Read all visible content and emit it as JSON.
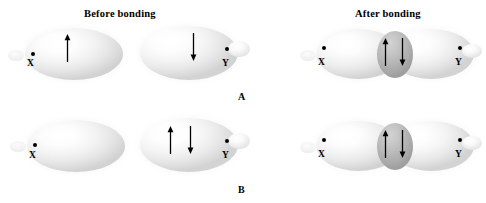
{
  "figure": {
    "title_before": "Before bonding",
    "title_after": "After bonding",
    "panels": [
      {
        "letter": "A",
        "before": {
          "atoms": [
            {
              "label": "X",
              "electrons": [
                "up"
              ],
              "orbital": "half-filled"
            },
            {
              "label": "Y",
              "electrons": [
                "down"
              ],
              "orbital": "half-filled"
            }
          ]
        },
        "after": {
          "atoms": [
            {
              "label": "X",
              "orbital": "overlapping"
            },
            {
              "label": "Y",
              "orbital": "overlapping"
            }
          ],
          "overlap_electrons": [
            "up",
            "down"
          ]
        }
      },
      {
        "letter": "B",
        "before": {
          "atoms": [
            {
              "label": "X",
              "electrons": [],
              "orbital": "empty"
            },
            {
              "label": "Y",
              "electrons": [
                "up",
                "down"
              ],
              "orbital": "filled"
            }
          ]
        },
        "after": {
          "atoms": [
            {
              "label": "X",
              "orbital": "overlapping"
            },
            {
              "label": "Y",
              "orbital": "overlapping"
            }
          ],
          "overlap_electrons": [
            "up",
            "down"
          ]
        }
      }
    ],
    "colors": {
      "ink": "#000000",
      "lobe_light": "#ffffff",
      "lobe_edge": "#d2d2d2",
      "overlap_fill": "#b6b6b6",
      "background": "#ffffff"
    },
    "arrow_glyphs": {
      "up": "↑",
      "down": "↓"
    }
  }
}
